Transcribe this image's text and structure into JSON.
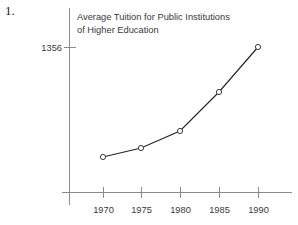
{
  "problem": {
    "number": "1."
  },
  "chart_data": {
    "type": "line",
    "title": "Average Tuition for Public Institutions of Higher Education",
    "title_lines": [
      "Average Tuition for Public Institutions",
      "of Higher Education"
    ],
    "xlabel": "",
    "ylabel": "",
    "categories": [
      "1970",
      "1975",
      "1980",
      "1985",
      "1990"
    ],
    "x": [
      1970,
      1975,
      1980,
      1985,
      1990
    ],
    "values": [
      268,
      325,
      432,
      722,
      1356
    ],
    "y_tick_labels": [
      "1356"
    ],
    "y_tick_values": [
      1356
    ],
    "ylim": [
      0,
      1500
    ],
    "xlim": [
      1966,
      1994
    ],
    "grid": false,
    "legend": false,
    "marker": "open-circle",
    "line_color": "#262626",
    "marker_fill": "#ffffff",
    "axis_color": "#8a8a8a",
    "text_color": "#3a3a3a",
    "background": "#ffffff",
    "points_px": [
      {
        "label": "1970",
        "x": 103,
        "y": 157
      },
      {
        "label": "1975",
        "x": 141,
        "y": 148
      },
      {
        "label": "1980",
        "x": 180,
        "y": 131
      },
      {
        "label": "1985",
        "x": 219,
        "y": 92
      },
      {
        "label": "1990",
        "x": 258,
        "y": 47
      }
    ]
  }
}
